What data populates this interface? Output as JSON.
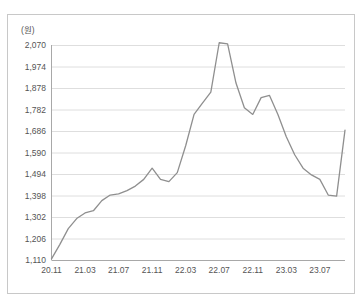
{
  "chart_data": {
    "type": "line",
    "title": "",
    "xlabel": "",
    "ylabel": "(원)",
    "y_unit": "(원)",
    "ylim": [
      1110,
      2070
    ],
    "ytick_labels": [
      "2,070",
      "1,974",
      "1,878",
      "1,782",
      "1,686",
      "1,590",
      "1,494",
      "1,398",
      "1,302",
      "1,206",
      "1,110"
    ],
    "ytick_values": [
      2070,
      1974,
      1878,
      1782,
      1686,
      1590,
      1494,
      1398,
      1302,
      1206,
      1110
    ],
    "xtick_labels": [
      "20.11",
      "21.03",
      "21.07",
      "21.11",
      "22.03",
      "22.07",
      "22.11",
      "23.03",
      "23.07"
    ],
    "grid": true,
    "legend": "none",
    "line_color": "#8f8f8f",
    "series": [
      {
        "name": "price",
        "x": [
          "20.11",
          "20.12",
          "21.01",
          "21.02",
          "21.03",
          "21.04",
          "21.05",
          "21.06",
          "21.07",
          "21.08",
          "21.09",
          "21.10",
          "21.11",
          "21.12",
          "22.01",
          "22.02",
          "22.03",
          "22.04",
          "22.05",
          "22.06",
          "22.07",
          "22.08",
          "22.09",
          "22.10",
          "22.11",
          "22.12",
          "23.01",
          "23.02",
          "23.03",
          "23.04",
          "23.05",
          "23.06",
          "23.07",
          "23.08",
          "23.09",
          "23.10"
        ],
        "values": [
          1115,
          1180,
          1250,
          1295,
          1320,
          1330,
          1375,
          1400,
          1405,
          1420,
          1440,
          1470,
          1520,
          1470,
          1460,
          1500,
          1620,
          1760,
          1810,
          1860,
          2080,
          2075,
          1900,
          1790,
          1760,
          1835,
          1845,
          1760,
          1660,
          1580,
          1520,
          1490,
          1470,
          1400,
          1395,
          1690
        ]
      }
    ]
  }
}
